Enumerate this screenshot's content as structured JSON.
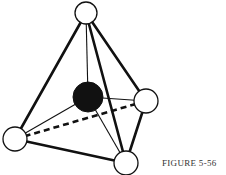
{
  "figure": {
    "caption": "FIGURE 5-56",
    "central_atom": {
      "x": 88,
      "y": 97,
      "r": 15,
      "fill": "#111111"
    },
    "outer_atoms": [
      {
        "name": "top",
        "x": 86,
        "y": 13,
        "r": 11
      },
      {
        "name": "right",
        "x": 146,
        "y": 101,
        "r": 12
      },
      {
        "name": "left",
        "x": 15,
        "y": 139,
        "r": 12
      },
      {
        "name": "bottom",
        "x": 126,
        "y": 163,
        "r": 12
      }
    ],
    "colors": {
      "stroke": "#111111",
      "atom_fill": "#ffffff"
    }
  }
}
